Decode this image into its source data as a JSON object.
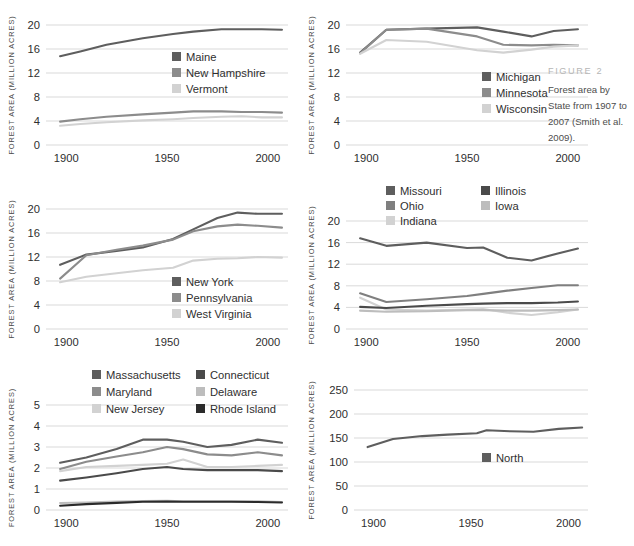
{
  "figure": {
    "label": "FIGURE 2",
    "caption": "Forest area by State from 1907 to 2007 (Smith et al. 2009).",
    "axis_title": "FOREST AREA (million acres)",
    "background": "#ffffff",
    "gridline_color": "#cfcfcf"
  },
  "palette": {
    "dark": "#5e5e5e",
    "medium": "#8c8c8c",
    "light": "#d2d2d2",
    "darker": "#4a4a4a",
    "lighter": "#bdbdbd",
    "black": "#2b2b2b"
  },
  "chart_data": [
    {
      "id": "northern-new-england",
      "type": "line",
      "title": "",
      "xlabel": "",
      "ylabel": "FOREST AREA (million acres)",
      "xlim": [
        1890,
        2010
      ],
      "ylim": [
        0,
        20
      ],
      "xticks": [
        1900,
        1950,
        2000
      ],
      "yticks": [
        0,
        4,
        8,
        12,
        16,
        20
      ],
      "grid": true,
      "legend_position": "center-right",
      "x": [
        1897,
        1907,
        1920,
        1938,
        1953,
        1963,
        1977,
        1987,
        1997,
        2007
      ],
      "series": [
        {
          "name": "Maine",
          "color": "#5e5e5e",
          "values": [
            14.8,
            15.6,
            16.7,
            17.8,
            18.5,
            18.9,
            19.3,
            19.3,
            19.3,
            19.2
          ]
        },
        {
          "name": "New Hampshire",
          "color": "#8c8c8c",
          "values": [
            3.9,
            4.3,
            4.7,
            5.1,
            5.4,
            5.6,
            5.6,
            5.5,
            5.5,
            5.4
          ]
        },
        {
          "name": "Vermont",
          "color": "#d2d2d2",
          "values": [
            3.2,
            3.5,
            3.8,
            4.1,
            4.3,
            4.5,
            4.7,
            4.8,
            4.6,
            4.6
          ]
        }
      ]
    },
    {
      "id": "lake-states",
      "type": "line",
      "title": "",
      "xlabel": "",
      "ylabel": "FOREST AREA (million acres)",
      "xlim": [
        1890,
        2010
      ],
      "ylim": [
        0,
        20
      ],
      "xticks": [
        1900,
        1950,
        2000
      ],
      "yticks": [
        0,
        4,
        8,
        12,
        16,
        20
      ],
      "grid": true,
      "legend_position": "center-right",
      "x": [
        1897,
        1910,
        1930,
        1955,
        1968,
        1982,
        1993,
        2005
      ],
      "series": [
        {
          "name": "Michigan",
          "color": "#5e5e5e",
          "values": [
            15.4,
            19.2,
            19.4,
            19.6,
            18.9,
            18.1,
            19.0,
            19.3
          ]
        },
        {
          "name": "Minnesota",
          "color": "#8c8c8c",
          "values": [
            15.3,
            19.2,
            19.4,
            18.1,
            16.7,
            16.6,
            16.7,
            16.6
          ]
        },
        {
          "name": "Wisconsin",
          "color": "#d2d2d2",
          "values": [
            15.2,
            17.5,
            17.2,
            15.8,
            15.4,
            15.9,
            16.4,
            16.6
          ]
        }
      ]
    },
    {
      "id": "mid-atlantic",
      "type": "line",
      "title": "",
      "xlabel": "",
      "ylabel": "FOREST AREA (million acres)",
      "xlim": [
        1890,
        2010
      ],
      "ylim": [
        0,
        20
      ],
      "xticks": [
        1900,
        1950,
        2000
      ],
      "yticks": [
        0,
        4,
        8,
        12,
        16,
        20
      ],
      "grid": true,
      "legend_position": "center-right",
      "x": [
        1897,
        1910,
        1925,
        1938,
        1953,
        1963,
        1975,
        1985,
        1995,
        2007
      ],
      "series": [
        {
          "name": "New York",
          "color": "#5e5e5e",
          "values": [
            10.7,
            12.4,
            13.0,
            13.6,
            15.0,
            16.6,
            18.5,
            19.4,
            19.2,
            19.2
          ]
        },
        {
          "name": "Pennsylvania",
          "color": "#8c8c8c",
          "values": [
            8.4,
            12.3,
            13.2,
            13.9,
            14.9,
            16.3,
            17.1,
            17.4,
            17.2,
            16.9
          ]
        },
        {
          "name": "West Virginia",
          "color": "#d2d2d2",
          "values": [
            7.8,
            8.7,
            9.3,
            9.8,
            10.2,
            11.4,
            11.7,
            11.8,
            12.0,
            11.9
          ]
        }
      ]
    },
    {
      "id": "central-states",
      "type": "line",
      "title": "",
      "xlabel": "",
      "ylabel": "FOREST AREA (million acres)",
      "xlim": [
        1890,
        2010
      ],
      "ylim": [
        0,
        20
      ],
      "xticks": [
        1900,
        1950,
        2000
      ],
      "yticks": [
        0,
        4,
        8,
        12,
        16,
        20
      ],
      "grid": true,
      "legend_position": "top-center",
      "x": [
        1897,
        1910,
        1930,
        1950,
        1958,
        1970,
        1982,
        1995,
        2005
      ],
      "series": [
        {
          "name": "Missouri",
          "color": "#5e5e5e",
          "values": [
            16.8,
            15.4,
            16.0,
            15.0,
            15.1,
            13.2,
            12.7,
            14.0,
            14.9
          ]
        },
        {
          "name": "Ohio",
          "color": "#7f7f7f",
          "values": [
            6.6,
            5.0,
            5.5,
            6.1,
            6.5,
            7.1,
            7.6,
            8.1,
            8.1
          ]
        },
        {
          "name": "Indiana",
          "color": "#d2d2d2",
          "values": [
            5.8,
            3.6,
            3.4,
            3.6,
            3.7,
            3.0,
            2.6,
            3.1,
            3.6
          ]
        },
        {
          "name": "Illinois",
          "color": "#4a4a4a",
          "values": [
            4.1,
            3.9,
            4.3,
            4.6,
            4.7,
            4.8,
            4.8,
            4.9,
            5.1
          ]
        },
        {
          "name": "Iowa",
          "color": "#bdbdbd",
          "values": [
            3.4,
            3.2,
            3.3,
            3.5,
            3.5,
            3.4,
            3.4,
            3.5,
            3.6
          ]
        }
      ]
    },
    {
      "id": "southern-new-england-mid-atlantic-small",
      "type": "line",
      "title": "",
      "xlabel": "",
      "ylabel": "FOREST AREA (million acres)",
      "xlim": [
        1890,
        2010
      ],
      "ylim": [
        0,
        5
      ],
      "xticks": [
        1900,
        1950,
        2000
      ],
      "yticks": [
        0,
        1,
        2,
        3,
        4,
        5
      ],
      "grid": true,
      "legend_position": "top-center",
      "x": [
        1897,
        1910,
        1925,
        1938,
        1950,
        1958,
        1970,
        1982,
        1995,
        2007
      ],
      "series": [
        {
          "name": "Massachusetts",
          "color": "#5e5e5e",
          "values": [
            2.25,
            2.5,
            2.9,
            3.35,
            3.35,
            3.25,
            3.0,
            3.1,
            3.35,
            3.2
          ]
        },
        {
          "name": "Maryland",
          "color": "#8c8c8c",
          "values": [
            1.95,
            2.3,
            2.55,
            2.75,
            3.0,
            2.9,
            2.65,
            2.6,
            2.75,
            2.6
          ]
        },
        {
          "name": "New Jersey",
          "color": "#d2d2d2",
          "values": [
            1.85,
            2.05,
            2.1,
            2.15,
            2.2,
            2.4,
            2.05,
            2.05,
            2.1,
            2.15
          ]
        },
        {
          "name": "Connecticut",
          "color": "#4a4a4a",
          "values": [
            1.4,
            1.55,
            1.75,
            1.95,
            2.05,
            1.95,
            1.9,
            1.9,
            1.9,
            1.85
          ]
        },
        {
          "name": "Delaware",
          "color": "#bdbdbd",
          "values": [
            0.33,
            0.36,
            0.4,
            0.43,
            0.44,
            0.42,
            0.42,
            0.42,
            0.41,
            0.38
          ]
        },
        {
          "name": "Rhode Island",
          "color": "#2b2b2b",
          "values": [
            0.2,
            0.28,
            0.34,
            0.39,
            0.4,
            0.39,
            0.39,
            0.39,
            0.38,
            0.36
          ]
        }
      ]
    },
    {
      "id": "north-region",
      "type": "line",
      "title": "",
      "xlabel": "",
      "ylabel": "FOREST AREA (million acres)",
      "xlim": [
        1890,
        2010
      ],
      "ylim": [
        0,
        250
      ],
      "xticks": [
        1900,
        1950,
        2000
      ],
      "yticks": [
        0,
        50,
        100,
        150,
        200,
        250
      ],
      "grid": true,
      "legend_position": "center-right",
      "x": [
        1897,
        1910,
        1925,
        1938,
        1953,
        1958,
        1970,
        1982,
        1995,
        2007
      ],
      "series": [
        {
          "name": "North",
          "color": "#5e5e5e",
          "values": [
            131,
            148,
            154,
            157,
            160,
            166,
            164,
            163,
            169,
            172
          ]
        }
      ]
    }
  ]
}
